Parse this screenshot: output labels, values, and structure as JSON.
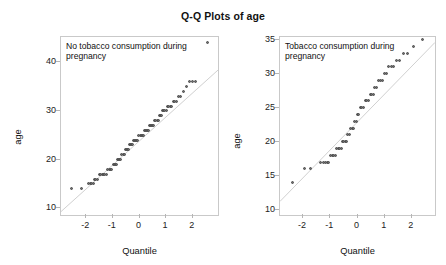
{
  "figure": {
    "title": "Q-Q Plots of age",
    "background": "#ffffff",
    "point_color": "#6f6f6f",
    "line_color": "#d0d0d0",
    "frame_color": "#c9c9c9"
  },
  "chart_data": [
    {
      "type": "scatter",
      "title": "Q-Q Plots of age",
      "panel_label": "No tobacco consumption during pregnancy",
      "xlabel": "Quantile",
      "ylabel": "age",
      "xlim": [
        -2.95,
        2.95
      ],
      "ylim": [
        8.6,
        45.2
      ],
      "xticks": [
        -2,
        -1,
        0,
        1,
        2
      ],
      "yticks": [
        10,
        20,
        30,
        40
      ],
      "grid": false,
      "legend": "none",
      "reference_line": {
        "x": [
          -2.95,
          2.95
        ],
        "y": [
          9.3,
          38.4
        ]
      },
      "x": [
        -2.55,
        -2.18,
        -1.93,
        -1.86,
        -1.8,
        -1.74,
        -1.69,
        -1.64,
        -1.56,
        -1.5,
        -1.45,
        -1.4,
        -1.35,
        -1.3,
        -1.25,
        -1.2,
        -1.14,
        -1.09,
        -1.04,
        -0.99,
        -0.94,
        -0.9,
        -0.86,
        -0.82,
        -0.78,
        -0.74,
        -0.7,
        -0.66,
        -0.62,
        -0.58,
        -0.54,
        -0.5,
        -0.46,
        -0.42,
        -0.38,
        -0.34,
        -0.3,
        -0.26,
        -0.22,
        -0.18,
        -0.14,
        -0.1,
        -0.06,
        -0.02,
        0.02,
        0.06,
        0.1,
        0.14,
        0.18,
        0.22,
        0.26,
        0.3,
        0.34,
        0.38,
        0.42,
        0.46,
        0.5,
        0.54,
        0.58,
        0.62,
        0.66,
        0.7,
        0.74,
        0.78,
        0.82,
        0.86,
        0.9,
        0.95,
        1.0,
        1.05,
        1.1,
        1.15,
        1.21,
        1.27,
        1.33,
        1.4,
        1.47,
        1.55,
        1.64,
        1.75,
        1.88,
        2.0,
        2.12,
        2.55
      ],
      "y": [
        14,
        14,
        15,
        15,
        15,
        15,
        16,
        16,
        16,
        17,
        17,
        17,
        17,
        17,
        17,
        18,
        18,
        18,
        18,
        19,
        19,
        19,
        19,
        20,
        20,
        20,
        20,
        21,
        21,
        21,
        22,
        22,
        22,
        22,
        23,
        23,
        23,
        23,
        24,
        24,
        24,
        24,
        24,
        25,
        25,
        25,
        25,
        25,
        26,
        26,
        26,
        26,
        26,
        27,
        27,
        27,
        27,
        27,
        28,
        28,
        28,
        28,
        29,
        29,
        29,
        30,
        30,
        30,
        30,
        31,
        31,
        31,
        31,
        32,
        32,
        32,
        33,
        33,
        34,
        35,
        36,
        36,
        36,
        44
      ]
    },
    {
      "type": "scatter",
      "title": "Q-Q Plots of age",
      "panel_label": "Tobacco consumption during pregnancy",
      "xlabel": "Quantile",
      "ylabel": "age",
      "xlim": [
        -2.85,
        2.85
      ],
      "ylim": [
        9.2,
        35.4
      ],
      "xticks": [
        -2,
        -1,
        0,
        1,
        2
      ],
      "yticks": [
        10,
        15,
        20,
        25,
        30,
        35
      ],
      "grid": false,
      "legend": "none",
      "reference_line": {
        "x": [
          -2.85,
          2.85
        ],
        "y": [
          11.2,
          34.6
        ]
      },
      "x": [
        -2.4,
        -1.95,
        -1.74,
        -1.35,
        -1.25,
        -1.18,
        -1.12,
        -1.06,
        -1.0,
        -0.93,
        -0.87,
        -0.81,
        -0.76,
        -0.7,
        -0.65,
        -0.6,
        -0.55,
        -0.5,
        -0.45,
        -0.4,
        -0.35,
        -0.3,
        -0.25,
        -0.2,
        -0.15,
        -0.1,
        -0.05,
        0.0,
        0.05,
        0.1,
        0.16,
        0.22,
        0.28,
        0.34,
        0.4,
        0.46,
        0.52,
        0.58,
        0.64,
        0.7,
        0.77,
        0.84,
        0.91,
        0.99,
        1.07,
        1.15,
        1.24,
        1.33,
        1.43,
        1.55,
        1.68,
        1.85,
        2.05,
        2.4
      ],
      "y": [
        14,
        16,
        16,
        17,
        17,
        17,
        17,
        17,
        18,
        18,
        18,
        18,
        19,
        19,
        19,
        19,
        20,
        20,
        20,
        20,
        21,
        21,
        22,
        22,
        22,
        23,
        23,
        24,
        24,
        25,
        25,
        25,
        26,
        26,
        26,
        27,
        27,
        27,
        28,
        28,
        29,
        29,
        29,
        30,
        30,
        31,
        31,
        31,
        32,
        32,
        33,
        33,
        34,
        35
      ]
    }
  ],
  "left_panel": {
    "label": "No tobacco consumption during pregnancy",
    "xlabel": "Quantile",
    "ylabel": "age",
    "yticks": [
      "10",
      "20",
      "30",
      "40"
    ],
    "xticks": [
      "-2",
      "-1",
      "0",
      "1",
      "2"
    ]
  },
  "right_panel": {
    "label": "Tobacco consumption during pregnancy",
    "xlabel": "Quantile",
    "ylabel": "age",
    "yticks": [
      "10",
      "15",
      "20",
      "25",
      "30",
      "35"
    ],
    "xticks": [
      "-2",
      "-1",
      "0",
      "1",
      "2"
    ]
  }
}
